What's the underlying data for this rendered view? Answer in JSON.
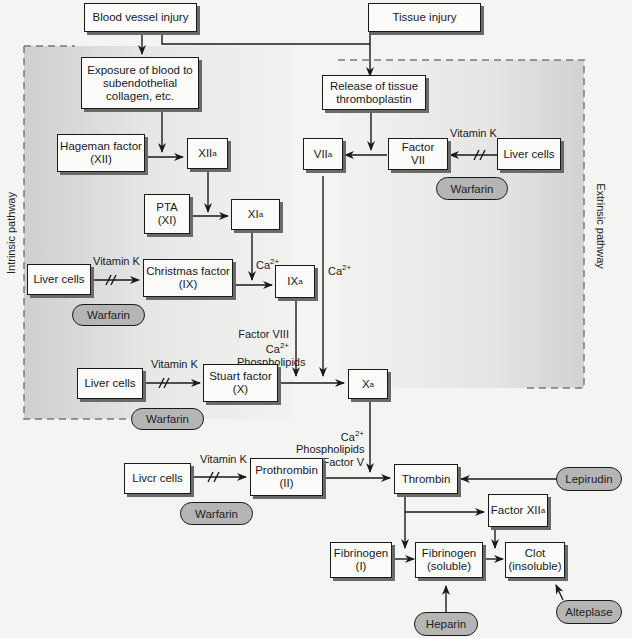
{
  "diagram": {
    "regions": {
      "intrinsic_label": "Intrinsic pathway",
      "extrinsic_label": "Extrinsic pathway"
    },
    "nodes": {
      "blood_vessel_injury": "Blood vessel injury",
      "tissue_injury": "Tissue injury",
      "exposure": "Exposure of blood to\nsubendothelial\ncollagen, etc.",
      "release_thromboplastin": "Release of tissue\nthromboplastin",
      "hageman": "Hageman factor\n(XII)",
      "xiia_base": "XII",
      "xiia_sub": "a",
      "viia_base": "VII",
      "viia_sub": "a",
      "factor_vii": "Factor\nVII",
      "liver_cells_1": "Liver cells",
      "pta": "PTA\n(XI)",
      "xia_base": "XI",
      "xia_sub": "a",
      "liver_cells_2": "Liver cells",
      "christmas": "Christmas factor\n(IX)",
      "ixa_base": "IX",
      "ixa_sub": "a",
      "liver_cells_3": "Liver cells",
      "stuart": "Stuart factor\n(X)",
      "xa_base": "X",
      "xa_sub": "a",
      "liver_cells_4": "Livcr cells",
      "prothrombin": "Prothrombin\n(II)",
      "thrombin": "Thrombin",
      "factor_xiiia_base": "Factor XII",
      "factor_xiiia_sub": "a",
      "fibrinogen_i": "Fibrinogen\n(I)",
      "fibrinogen_soluble": "Fibrinogen\n(soluble)",
      "clot": "Clot\n(insoluble)"
    },
    "drugs": {
      "warfarin_1": "Warfarin",
      "warfarin_2": "Warfarin",
      "warfarin_3": "Warfarin",
      "warfarin_4": "Warfarin",
      "lepirudin": "Lepirudin",
      "heparin": "Heparin",
      "alteplase": "Alteplase"
    },
    "labels": {
      "vitamin_k_1": "Vitamin K",
      "vitamin_k_2": "Vitamin K",
      "vitamin_k_3": "Vitamin K",
      "vitamin_k_4": "Vitamin K",
      "ca_xia": "Ca",
      "ca_xia_sup": "2+",
      "ca_viia": "Ca",
      "ca_viia_sup": "2+",
      "ixa_cofactor_1": "Factor VIII",
      "ixa_cofactor_2": "Ca",
      "ixa_cofactor_2_sup": "2+",
      "ixa_cofactor_3": "Phospholipids",
      "xa_cofactor_1": "Ca",
      "xa_cofactor_1_sup": "2+",
      "xa_cofactor_2": "Phospholipids",
      "xa_cofactor_3": "Factor V"
    },
    "colors": {
      "background": "#f4f4f2",
      "region_shade": "#d8d8d8",
      "box_fill": "#fbfbfa",
      "drug_fill": "#b5b5b5",
      "line": "#1a1a1a",
      "dash": "#7a7a7a"
    }
  }
}
